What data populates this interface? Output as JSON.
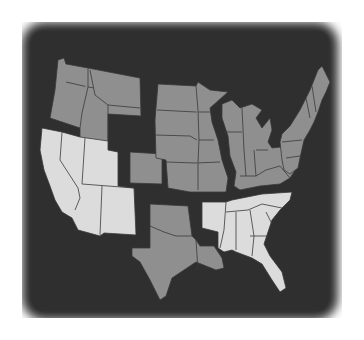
{
  "map": {
    "subject": "Contiguous United States divided into regions",
    "style": "grayscale, dark background, soft vignette edge",
    "colors": {
      "background": "#2f2f2f",
      "region_dark": "#8f8f8f",
      "region_light": "#dcdcdc",
      "borders": "#3a3a3a",
      "page": "#ffffff"
    },
    "regions": [
      {
        "name": "Northwest",
        "shade": "dark",
        "states": [
          "Washington",
          "Oregon",
          "Idaho",
          "Montana",
          "Wyoming"
        ]
      },
      {
        "name": "Southwest",
        "shade": "light",
        "states": [
          "California",
          "Nevada",
          "Utah",
          "Arizona",
          "New Mexico"
        ]
      },
      {
        "name": "Colorado",
        "shade": "dark",
        "states": [
          "Colorado"
        ]
      },
      {
        "name": "Plains",
        "shade": "dark",
        "states": [
          "North Dakota",
          "South Dakota",
          "Nebraska",
          "Kansas",
          "Minnesota",
          "Iowa",
          "Missouri"
        ]
      },
      {
        "name": "South Central",
        "shade": "dark",
        "states": [
          "Oklahoma",
          "Texas",
          "Louisiana"
        ]
      },
      {
        "name": "Great Lakes",
        "shade": "dark",
        "states": [
          "Wisconsin",
          "Michigan",
          "Illinois",
          "Indiana",
          "Ohio",
          "Kentucky"
        ]
      },
      {
        "name": "Northeast",
        "shade": "dark",
        "states": [
          "Maine",
          "New Hampshire",
          "Vermont",
          "Massachusetts",
          "New York",
          "Pennsylvania",
          "New Jersey",
          "West Virginia",
          "Virginia",
          "Maryland"
        ]
      },
      {
        "name": "Southeast",
        "shade": "light",
        "states": [
          "Arkansas",
          "Tennessee",
          "North Carolina",
          "South Carolina",
          "Mississippi",
          "Alabama",
          "Georgia",
          "Florida"
        ]
      }
    ]
  }
}
